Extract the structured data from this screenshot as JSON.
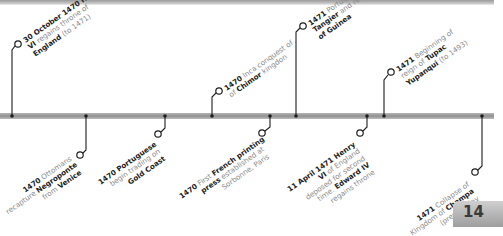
{
  "page_number": "14",
  "colors": {
    "bar": "#9a9a9a",
    "line": "#1e1e1e",
    "text_dim": "#8a8a8a",
    "text_bold": "#222222"
  },
  "events_above": [
    {
      "date": "30 October 1470",
      "parts": [
        "Henry",
        " VI",
        " regains throne of ",
        "England",
        " (to 1471)"
      ]
    },
    {
      "date": "1470",
      "parts": [
        " Inca conquest of ",
        "Chimor",
        " kingdon"
      ]
    },
    {
      "date": "1471",
      "parts": [
        " Portuguese gain ",
        "Tangier",
        " and reach ",
        "Gulf of Guinea"
      ]
    },
    {
      "date": "1471",
      "parts": [
        " Beginning of reign of ",
        "Tupac Yupanqui",
        " (to 1493)"
      ]
    }
  ],
  "events_below": [
    {
      "date": "1470",
      "parts": [
        " Ottomans recapture ",
        "Negroponte",
        " from ",
        "Venice"
      ]
    },
    {
      "date": "1470",
      "parts": [
        " ",
        "Portuguese",
        " begin trading on ",
        "Gold Coast"
      ]
    },
    {
      "date": "1470",
      "parts": [
        " First ",
        "French printing press",
        " established at Sorbonne, Paris"
      ]
    },
    {
      "date": "11 April 1471",
      "parts": [
        " Henry VI",
        " of England deposed for second time. ",
        "Edward IV",
        " regains throne"
      ]
    },
    {
      "date": "1471",
      "parts": [
        " Collapse of Kingdom of ",
        "Champa",
        " (present-day Vietnam)"
      ]
    }
  ]
}
